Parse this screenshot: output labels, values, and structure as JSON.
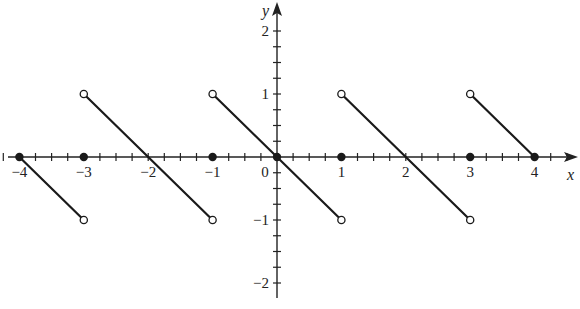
{
  "chart_data": {
    "type": "line",
    "title": "",
    "xlabel": "x",
    "ylabel": "y",
    "xlim": [
      -4.3,
      4.6
    ],
    "ylim": [
      -2.2,
      2.4
    ],
    "grid": false,
    "x_ticks": [
      -4,
      -3,
      -2,
      -1,
      0,
      1,
      2,
      3,
      4
    ],
    "x_tick_labels": [
      "−4",
      "−3",
      "−2",
      "−1",
      "0",
      "1",
      "2",
      "3",
      "4"
    ],
    "y_ticks": [
      -2,
      -1,
      1,
      2
    ],
    "y_tick_labels": [
      "−2",
      "−1",
      "1",
      "2"
    ],
    "minor_tick_step": 0.25,
    "segments": [
      {
        "x": [
          -4,
          -3
        ],
        "y": [
          0,
          -1
        ],
        "start": "closed",
        "end": "open"
      },
      {
        "x": [
          -3,
          -1
        ],
        "y": [
          1,
          -1
        ],
        "start": "open",
        "end": "open"
      },
      {
        "x": [
          -1,
          1
        ],
        "y": [
          1,
          -1
        ],
        "start": "open",
        "end": "open"
      },
      {
        "x": [
          1,
          3
        ],
        "y": [
          1,
          -1
        ],
        "start": "open",
        "end": "open"
      },
      {
        "x": [
          3,
          4
        ],
        "y": [
          1,
          0
        ],
        "start": "open",
        "end": "closed"
      }
    ],
    "filled_points": [
      [
        -4,
        0
      ],
      [
        -3,
        0
      ],
      [
        -1,
        0
      ],
      [
        0,
        0
      ],
      [
        1,
        0
      ],
      [
        3,
        0
      ],
      [
        4,
        0
      ]
    ],
    "open_points": [
      [
        -3,
        1
      ],
      [
        -3,
        -1
      ],
      [
        -1,
        1
      ],
      [
        -1,
        -1
      ],
      [
        1,
        1
      ],
      [
        1,
        -1
      ],
      [
        3,
        1
      ],
      [
        3,
        -1
      ]
    ],
    "colors": {
      "line": "#1a1a1a",
      "axis": "#222222",
      "background": "#ffffff"
    }
  }
}
